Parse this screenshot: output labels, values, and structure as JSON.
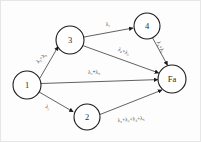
{
  "diagram": {
    "background_color": "#fdfdfd",
    "node_stroke_color": "#1a1a1a",
    "edge_color": "#4f4f4f",
    "text_color": "#2b2b2b",
    "nodes": [
      {
        "id": "1",
        "label": "1",
        "cx": 27,
        "cy": 85,
        "r": 14
      },
      {
        "id": "2",
        "label": "2",
        "cx": 87,
        "cy": 117,
        "r": 13
      },
      {
        "id": "3",
        "label": "3",
        "cx": 70,
        "cy": 40,
        "r": 14
      },
      {
        "id": "4",
        "label": "4",
        "cx": 147,
        "cy": 26,
        "r": 13
      },
      {
        "id": "Fa",
        "label": "Fa",
        "cx": 172,
        "cy": 79,
        "r": 14
      }
    ],
    "edges": [
      {
        "id": "e1",
        "from": "1",
        "to": "3",
        "label": "λ₂+λ₃",
        "label_terms": [
          "λ2",
          "λ3"
        ],
        "label_x": 41,
        "label_y": 58,
        "label_rotation": -45
      },
      {
        "id": "e2",
        "from": "3",
        "to": "4",
        "label": "λ₁",
        "label_terms": [
          "λ1"
        ],
        "label_x": 108,
        "label_y": 24,
        "label_rotation": 0
      },
      {
        "id": "e3",
        "from": "3",
        "to": "Fa",
        "label": "λ₄+λ₅",
        "label_terms": [
          "λ4",
          "λ5"
        ],
        "label_x": 124,
        "label_y": 51,
        "label_rotation": 24
      },
      {
        "id": "e4",
        "from": "4",
        "to": "Fa",
        "label": "λ₄+λ₅",
        "label_terms": [
          "λ4",
          "λ5"
        ],
        "label_x": 161,
        "label_y": 47,
        "label_rotation": 66
      },
      {
        "id": "e5",
        "from": "1",
        "to": "Fa",
        "label": "λ₄+λ₅",
        "label_terms": [
          "λ4",
          "λ5"
        ],
        "label_x": 94,
        "label_y": 72,
        "label_rotation": 0
      },
      {
        "id": "e6",
        "from": "1",
        "to": "2",
        "label": "λ₁",
        "label_terms": [
          "λ1"
        ],
        "label_x": 48,
        "label_y": 107,
        "label_rotation": 25
      },
      {
        "id": "e7",
        "from": "2",
        "to": "Fa",
        "label": "λ₂+λ₃+λ₄+λ₅",
        "label_terms": [
          "λ2",
          "λ3",
          "λ4",
          "λ5"
        ],
        "label_x": 131,
        "label_y": 119,
        "label_rotation": -5
      }
    ]
  }
}
